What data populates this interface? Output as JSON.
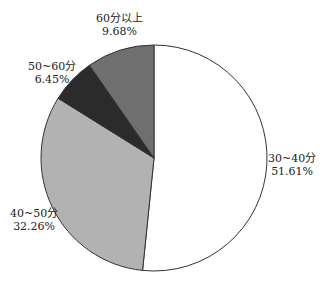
{
  "chart_data": {
    "type": "pie",
    "title": "",
    "categories": [
      "30~40分",
      "40~50分",
      "50~60分",
      "60分以上"
    ],
    "values": [
      51.61,
      32.26,
      6.45,
      9.68
    ],
    "value_labels": [
      "51.61%",
      "32.26%",
      "6.45%",
      "9.68%"
    ],
    "colors": [
      "#ffffff",
      "#b2b2b2",
      "#2b2b2b",
      "#6f6f6f"
    ],
    "start_angle_deg": 0,
    "direction": "clockwise",
    "legend": "none",
    "labels_position": "outside"
  },
  "labels": {
    "s0": {
      "name": "30~40分",
      "pct": "51.61%"
    },
    "s1": {
      "name": "40~50分",
      "pct": "32.26%"
    },
    "s2": {
      "name": "50~60分",
      "pct": "6.45%"
    },
    "s3": {
      "name": "60分以上",
      "pct": "9.68%"
    }
  }
}
